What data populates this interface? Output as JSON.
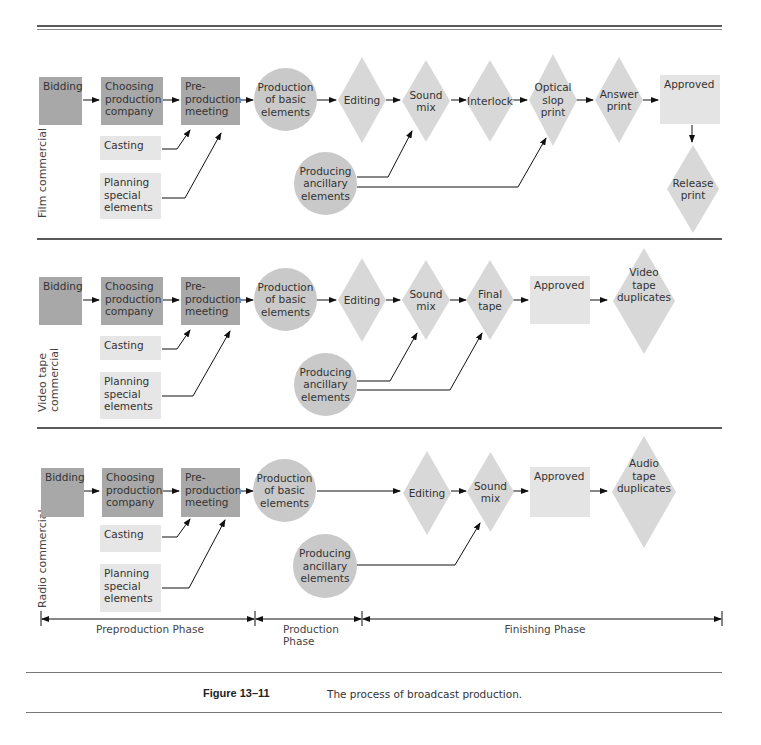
{
  "figure": {
    "number": "Figure 13–11",
    "caption": "The process of broadcast production."
  },
  "colors": {
    "dark_box": "#a8a8a8",
    "light_box": "#e6e6e6",
    "circle": "#c9c9c9",
    "diamond": "#d8d8d8",
    "rule": "#5a5a5a"
  },
  "sections": [
    {
      "label": "Film commercial",
      "nodes": {
        "bidding": "Bidding",
        "choosing": "Choosing\nproduction\ncompany",
        "preprod": "Pre-\nproduction\nmeeting",
        "production": "Production\nof basic\nelements",
        "editing": "Editing",
        "sound_mix": "Sound\nmix",
        "interlock": "Interlock",
        "optical": "Optical\nslop\nprint",
        "answer": "Answer\nprint",
        "approved": "Approved",
        "release": "Release\nprint",
        "casting": "Casting",
        "planning": "Planning\nspecial\nelements",
        "ancillary": "Producing\nancillary\nelements"
      }
    },
    {
      "label": "Video tape\ncommercial",
      "nodes": {
        "bidding": "Bidding",
        "choosing": "Choosing\nproduction\ncompany",
        "preprod": "Pre-\nproduction\nmeeting",
        "production": "Production\nof basic\nelements",
        "editing": "Editing",
        "sound_mix": "Sound\nmix",
        "final_tape": "Final\ntape",
        "approved": "Approved",
        "duplicates": "Video\ntape\nduplicates",
        "casting": "Casting",
        "planning": "Planning\nspecial\nelements",
        "ancillary": "Producing\nancillary\nelements"
      }
    },
    {
      "label": "Radio commercial",
      "nodes": {
        "bidding": "Bidding",
        "choosing": "Choosing\nproduction\ncompany",
        "preprod": "Pre-\nproduction\nmeeting",
        "production": "Production\nof basic\nelements",
        "editing": "Editing",
        "sound_mix": "Sound\nmix",
        "approved": "Approved",
        "duplicates": "Audio\ntape\nduplicates",
        "casting": "Casting",
        "planning": "Planning\nspecial\nelements",
        "ancillary": "Producing\nancillary\nelements"
      }
    }
  ],
  "phases": [
    {
      "label": "Preproduction Phase"
    },
    {
      "label": "Production\nPhase"
    },
    {
      "label": "Finishing Phase"
    }
  ]
}
